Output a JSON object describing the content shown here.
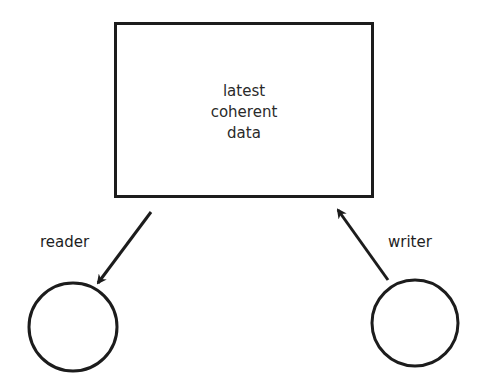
{
  "diagram": {
    "title": "",
    "store": {
      "label_lines": [
        "latest",
        "coherent",
        "data"
      ]
    },
    "nodes": [
      {
        "id": "reader",
        "label": "reader",
        "shape": "circle"
      },
      {
        "id": "writer",
        "label": "writer",
        "shape": "circle"
      }
    ],
    "edges": [
      {
        "from": "store",
        "to": "reader",
        "label": "reader",
        "direction": "store-to-reader"
      },
      {
        "from": "writer",
        "to": "store",
        "label": "writer",
        "direction": "writer-to-store"
      }
    ],
    "colors": {
      "stroke": "#1c1c1c",
      "text": "#2a2a2a",
      "background": "#ffffff"
    }
  }
}
